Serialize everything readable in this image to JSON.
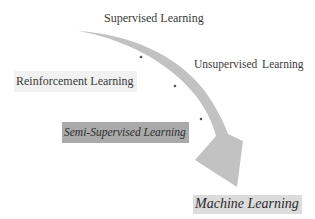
{
  "diagram": {
    "labels": {
      "supervised": "Supervised Learning",
      "unsupervised": "Unsupervised  Learning",
      "reinforcement": "Reinforcement Learning",
      "semi_supervised": "Semi-Supervised Learning",
      "machine_learning": "Machine Learning"
    },
    "colors": {
      "arrow": "#c2c2c2",
      "semi_box": "#aaaaaa",
      "ml_box": "#dcdcdc",
      "reinforcement_box": "#f1f1f1",
      "text": "#3a3a3a"
    },
    "arrow": {
      "direction": "curved, top-left to bottom-right",
      "markers": 3
    }
  }
}
